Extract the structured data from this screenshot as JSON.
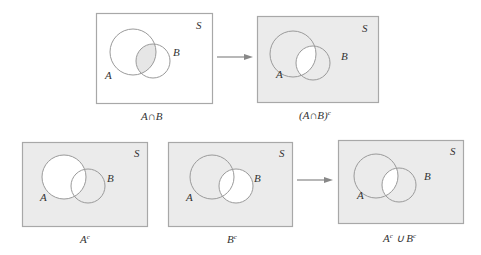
{
  "colors": {
    "shaded": "#ebebeb",
    "unshaded": "#ffffff",
    "outline": "#a8a8a8",
    "circle": "#9a9a9a",
    "arrow": "#888888"
  },
  "panels": [
    {
      "id": "a-intersect-b",
      "caption": "A∩B",
      "universe_label": "S",
      "set_a_label": "A",
      "set_b_label": "B",
      "shading": "intersection only"
    },
    {
      "id": "complement-of-intersection",
      "caption": "(A∩B)",
      "caption_sup": "c",
      "universe_label": "S",
      "set_a_label": "A",
      "set_b_label": "B",
      "shading": "everything except intersection"
    },
    {
      "id": "a-complement",
      "caption": "A",
      "caption_sup": "c",
      "universe_label": "S",
      "set_a_label": "A",
      "set_b_label": "B",
      "shading": "everything except A"
    },
    {
      "id": "b-complement",
      "caption": "B",
      "caption_sup": "c",
      "universe_label": "S",
      "set_a_label": "A",
      "set_b_label": "B",
      "shading": "everything except B"
    },
    {
      "id": "union-of-complements",
      "caption_a": "A",
      "caption_a_sup": "c",
      "caption_op": " ∪ ",
      "caption_b": "B",
      "caption_b_sup": "c",
      "universe_label": "S",
      "set_a_label": "A",
      "set_b_label": "B",
      "shading": "everything except intersection"
    }
  ]
}
